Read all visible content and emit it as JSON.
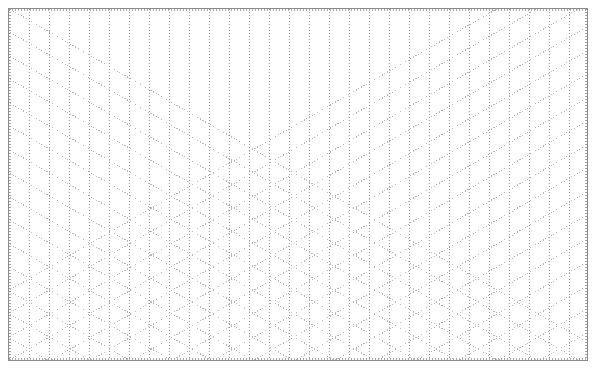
{
  "document": {
    "title": "Isometric Triangle Dot Grid Paper",
    "kind": "graph-paper",
    "width_px": 596,
    "height_px": 369,
    "background_color": "#ffffff"
  },
  "frame": {
    "name": "paper-border",
    "left_px": 8,
    "top_px": 8,
    "width_px": 580,
    "height_px": 353,
    "border_color": "#8a8a92",
    "border_width_px": 1
  },
  "grid": {
    "style": "dotted",
    "geometry": "isometric-triangular",
    "dot_color": "#b9b9c2",
    "dot_color_dark": "#9d9da8",
    "dot_size_px": 1,
    "dot_gap_px": 2,
    "horizontal_period_px": 40,
    "vertical_period_px": 23.5,
    "column_spacing_px": 20,
    "diagonal_angle_deg": 30,
    "line_families": [
      {
        "name": "vertical-lines",
        "angle_deg": 90,
        "spacing_px": 20
      },
      {
        "name": "diagonal-up-lines",
        "angle_deg": 30,
        "spacing_px": 23.5
      },
      {
        "name": "diagonal-down-lines",
        "angle_deg": -30,
        "spacing_px": 23.5
      }
    ],
    "columns_count": 30,
    "rows_count": 16
  },
  "edge_band": {
    "name": "tick-band",
    "color": "#9a9aa2",
    "tick_period_px": 3
  },
  "chart_data": {
    "type": "table",
    "title": "Isometric Triangle Dot Grid Paper",
    "xlabel": "",
    "ylabel": "",
    "grid": true,
    "legend": "none",
    "categories": [
      "vertical-lines",
      "diagonal-up-lines",
      "diagonal-down-lines"
    ],
    "values": [
      30,
      16,
      16
    ]
  }
}
